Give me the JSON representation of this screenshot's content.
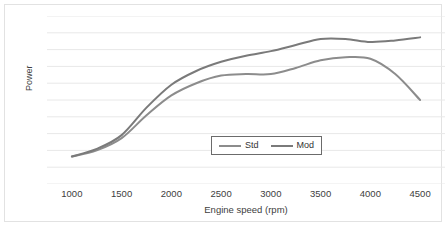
{
  "chart_data": {
    "type": "line",
    "title": "",
    "xlabel": "Engine speed (rpm)",
    "ylabel": "Power",
    "xlim": [
      750,
      4750
    ],
    "ylim": [
      0,
      110
    ],
    "grid": true,
    "grid_axis": "y",
    "gridline_count": 11,
    "legend_position": "inside-bottom-center",
    "x_ticks": [
      "1000",
      "1500",
      "2000",
      "2500",
      "3000",
      "3500",
      "4000",
      "4500"
    ],
    "y_ticks": [],
    "x": [
      1000,
      1250,
      1500,
      1750,
      2000,
      2250,
      2500,
      2750,
      3000,
      3250,
      3500,
      3750,
      4000,
      4250,
      4500
    ],
    "series": [
      {
        "name": "Std",
        "color": "#8c8c8c",
        "values": [
          18,
          22,
          30,
          45,
          58,
          66,
          71,
          72,
          72,
          76,
          81,
          83,
          82,
          72,
          55
        ]
      },
      {
        "name": "Mod",
        "color": "#7a7a7a",
        "values": [
          18,
          23,
          32,
          50,
          65,
          74,
          80,
          84,
          87,
          91,
          95,
          95,
          93,
          94,
          96
        ]
      }
    ]
  },
  "legend": {
    "entries": [
      {
        "label": "Std"
      },
      {
        "label": "Mod"
      }
    ]
  },
  "axes": {
    "x_title": "Engine speed (rpm)",
    "y_title": "Power"
  },
  "colors": {
    "std_line": "#8c8c8c",
    "mod_line": "#7a7a7a",
    "gridline": "#e8e8e8",
    "frame": "#e2e2e2",
    "text": "#404040",
    "legend_border": "#6b6b6b",
    "background": "#ffffff"
  }
}
